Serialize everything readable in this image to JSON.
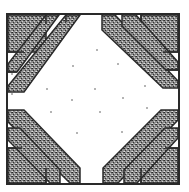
{
  "diagram": {
    "type": "quilt-block",
    "colors": {
      "background": "#ffffff",
      "outline": "#2a2a2a",
      "shade": "#7a7a7a",
      "dot": "#555555"
    },
    "block": {
      "x": 7,
      "y": 14,
      "size": 172
    },
    "corners": [
      "top-left",
      "top-right",
      "bottom-left",
      "bottom-right"
    ]
  }
}
